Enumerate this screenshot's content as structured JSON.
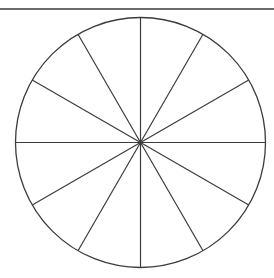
{
  "diagram": {
    "type": "divided-circle",
    "sections": 12,
    "center": [
      140.5,
      142.5
    ],
    "radius": 125,
    "stroke_color": "#3c3c3c",
    "rule_color": "#6a6a6a",
    "background": "#ffffff"
  }
}
